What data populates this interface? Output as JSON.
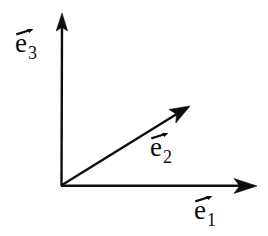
{
  "figure": {
    "background_color": "#ffffff",
    "stroke_color": "#0d0d0d",
    "width": 268,
    "height": 236
  },
  "origin": {
    "x": 61,
    "y": 186
  },
  "axes": [
    {
      "id": "e3",
      "name": "vertical-axis",
      "label_base": "e",
      "label_subscript": "3",
      "direction": "up",
      "from": {
        "x": 61,
        "y": 186
      },
      "to": {
        "x": 62,
        "y": 14
      },
      "angle_deg": 90,
      "arrowhead": true
    },
    {
      "id": "e2",
      "name": "diagonal-axis",
      "label_base": "e",
      "label_subscript": "2",
      "direction": "up-right",
      "from": {
        "x": 61,
        "y": 186
      },
      "to": {
        "x": 189,
        "y": 107
      },
      "angle_deg": 31.7,
      "arrowhead": true
    },
    {
      "id": "e1",
      "name": "horizontal-axis",
      "label_base": "e",
      "label_subscript": "1",
      "direction": "right",
      "from": {
        "x": 61,
        "y": 186
      },
      "to": {
        "x": 256,
        "y": 186
      },
      "angle_deg": 0,
      "arrowhead": true
    }
  ],
  "labels": {
    "e3": {
      "base": "e",
      "sub": "3",
      "overset": "vector-arrow"
    },
    "e2": {
      "base": "e",
      "sub": "2",
      "overset": "vector-arrow"
    },
    "e1": {
      "base": "e",
      "sub": "1",
      "overset": "vector-arrow"
    }
  }
}
